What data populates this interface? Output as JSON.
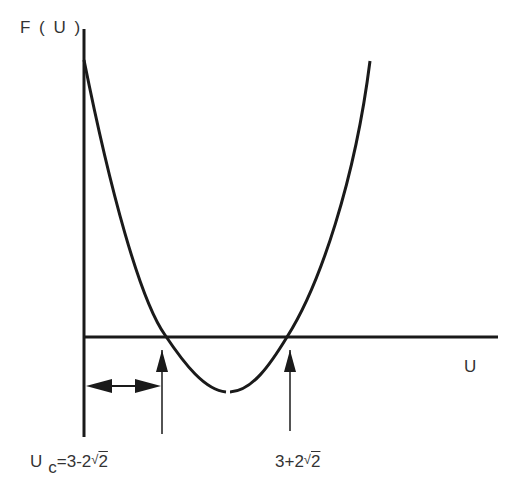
{
  "diagram": {
    "y_axis_label": "F ( U )",
    "x_axis_label": "U",
    "left_marker": {
      "prefix": "U",
      "subscript": "c",
      "expr": "=3-2",
      "sqrt_symbol": "√",
      "radicand": "2"
    },
    "right_marker": {
      "expr": "3+2",
      "sqrt_symbol": "√",
      "radicand": "2"
    },
    "stroke_color": "#1a1a1a",
    "background": "#ffffff"
  }
}
